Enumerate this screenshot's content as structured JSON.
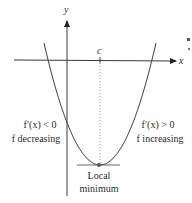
{
  "diagram": {
    "axes": {
      "x_label": "x",
      "y_label": "y"
    },
    "critical_point": {
      "label": "c"
    },
    "left_region": {
      "derivative_condition": "f′(x) < 0",
      "behavior": "f decreasing"
    },
    "right_region": {
      "derivative_condition": "f′(x) > 0",
      "behavior": "f increasing"
    },
    "extremum": {
      "line1": "Local",
      "line2": "minimum"
    },
    "colors": {
      "axis": "#3a3a3a",
      "curve": "#4a4a4a",
      "text": "#2a2a2a",
      "point": "#555555"
    }
  }
}
